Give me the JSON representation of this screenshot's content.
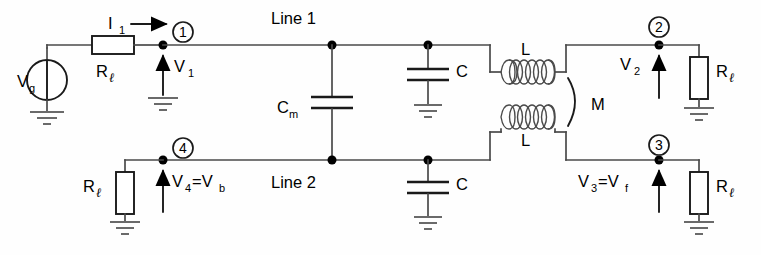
{
  "diagram": {
    "background_color": "#fefefe",
    "line_color": "#4a4a4a",
    "component_color": "#1a1a1a"
  },
  "labels": {
    "source": "V",
    "source_sub": "g",
    "current": "I",
    "current_sub": "1",
    "resistor": "R",
    "resistor_sub": "ℓ",
    "line1": "Line 1",
    "line2": "Line 2",
    "cap_mutual": "C",
    "cap_mutual_sub": "m",
    "cap_shunt": "C",
    "inductor": "L",
    "mutual": "M",
    "v1": "V",
    "v1_sub": "1",
    "v2": "V",
    "v2_sub": "2",
    "v3": "V",
    "v3_sub": "3",
    "v3_eq": "=V",
    "v3_eq_sub": "f",
    "v4": "V",
    "v4_sub": "4",
    "v4_eq": "=V",
    "v4_eq_sub": "b"
  },
  "nodes": {
    "n1": "1",
    "n2": "2",
    "n3": "3",
    "n4": "4"
  },
  "components": [
    {
      "name": "voltage-source",
      "label": "Vg",
      "type": "source"
    },
    {
      "name": "resistor-rl-input",
      "label": "Rℓ",
      "type": "resistor"
    },
    {
      "name": "resistor-rl-node2",
      "label": "Rℓ",
      "type": "resistor"
    },
    {
      "name": "resistor-rl-node3",
      "label": "Rℓ",
      "type": "resistor"
    },
    {
      "name": "resistor-rl-node4",
      "label": "Rℓ",
      "type": "resistor"
    },
    {
      "name": "capacitor-cm",
      "label": "Cm",
      "type": "capacitor"
    },
    {
      "name": "capacitor-c-top",
      "label": "C",
      "type": "capacitor"
    },
    {
      "name": "capacitor-c-bottom",
      "label": "C",
      "type": "capacitor"
    },
    {
      "name": "inductor-l-top",
      "label": "L",
      "type": "inductor"
    },
    {
      "name": "inductor-l-bottom",
      "label": "L",
      "type": "inductor"
    }
  ]
}
